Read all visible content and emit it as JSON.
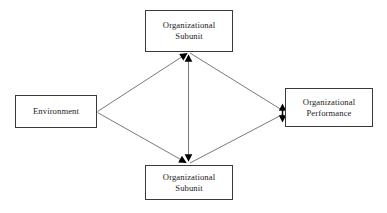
{
  "diagram": {
    "type": "flow-diagram",
    "background_color": "#ffffff",
    "line_color": "#7a7a7a",
    "border_color": "#3a3a3a",
    "text_color": "#1c1c1c",
    "nodes": [
      {
        "id": "top-subunit",
        "label": "Organizational\nSubunit",
        "x": 145,
        "y": 10,
        "width": 88,
        "height": 42
      },
      {
        "id": "environment",
        "label": "Environment",
        "x": 15,
        "y": 95,
        "width": 82,
        "height": 33
      },
      {
        "id": "performance",
        "label": "Organizational\nPerformance",
        "x": 285,
        "y": 88,
        "width": 88,
        "height": 39
      },
      {
        "id": "bottom-subunit",
        "label": "Organizational\nSubunit",
        "x": 145,
        "y": 165,
        "width": 88,
        "height": 35
      }
    ],
    "connectors": [
      {
        "id": "environment-to-top-subunit",
        "from": "environment",
        "to": "top-subunit",
        "arrow": "single",
        "direction": "to-target"
      },
      {
        "id": "environment-to-bottom-subunit",
        "from": "environment",
        "to": "bottom-subunit",
        "arrow": "single",
        "direction": "to-target"
      },
      {
        "id": "top-subunit-to-performance",
        "from": "top-subunit",
        "to": "performance",
        "arrow": "single",
        "direction": "to-target"
      },
      {
        "id": "bottom-subunit-to-performance",
        "from": "bottom-subunit",
        "to": "performance",
        "arrow": "single",
        "direction": "to-target"
      },
      {
        "id": "subunit-to-subunit",
        "from": "top-subunit",
        "to": "bottom-subunit",
        "arrow": "double",
        "direction": "bidirectional"
      }
    ]
  }
}
